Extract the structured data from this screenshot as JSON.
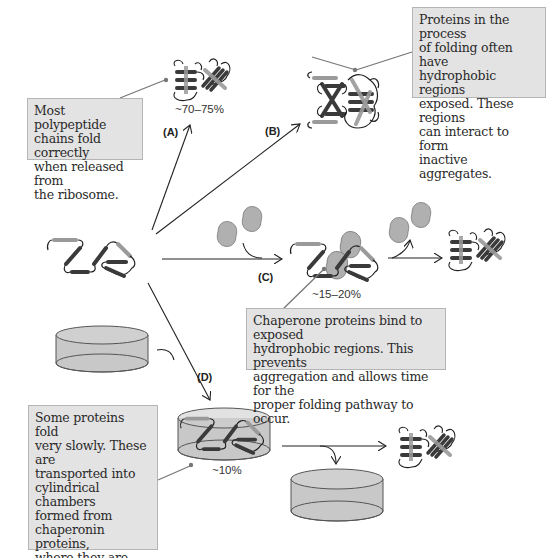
{
  "notes": {
    "correct_folding": "Most polypeptide\nchains fold correctly\nwhen released from\nthe ribosome.",
    "aggregation": "Proteins in the process\nof folding often have\nhydrophobic regions\nexposed. These regions\ncan interact to form\ninactive aggregates.",
    "chaperone": "Chaperone proteins bind to exposed\nhydrophobic regions. This prevents\naggregation and allows time for the\nproper folding pathway to occur.",
    "chaperonin": "Some proteins fold\nvery slowly. These are\ntransported into\ncylindrical chambers\nformed from\nchaperonin proteins,\nwhere they are able\nto fold in a region\nisolated from the\nsurroundings."
  },
  "pathways": {
    "a": {
      "label": "(A)",
      "percent": "~70–75%"
    },
    "b": {
      "label": "(B)"
    },
    "c": {
      "label": "(C)",
      "percent": "~15–20%"
    },
    "d": {
      "label": "(D)",
      "percent": "~10%"
    }
  },
  "colors": {
    "box_fill": "#e3e3e3",
    "box_border": "#b5b5b5",
    "helix_dark": "#3a3a3a",
    "helix_light": "#9a9a9a",
    "chaperone_fill": "#b0b0b0",
    "cylinder_fill": "#c8c8c8",
    "leader_line": "#777777"
  }
}
